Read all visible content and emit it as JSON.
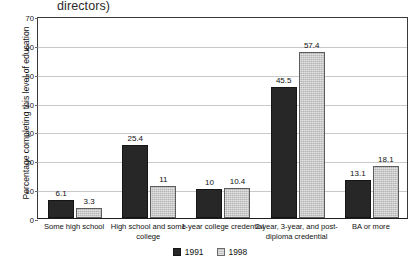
{
  "chart_data": {
    "type": "bar",
    "title": "directors)",
    "xlabel": "",
    "ylabel": "Percentage completing this level of education",
    "ylim": [
      0,
      70
    ],
    "ytick_step": 10,
    "yticks": [
      "0",
      "10",
      "20",
      "30",
      "40",
      "50",
      "60",
      "70"
    ],
    "grid": true,
    "legend_position": "bottom-center",
    "categories": [
      "Some high school",
      "High school and some college",
      "1-year college credential",
      "2-year, 3-year, and post-diploma credential",
      "BA or more"
    ],
    "series": [
      {
        "name": "1991",
        "color": "#272727",
        "values": [
          6.1,
          25.4,
          10,
          45.5,
          13.1
        ],
        "value_labels": [
          "6.1",
          "25.4",
          "10",
          "45.5",
          "13.1"
        ]
      },
      {
        "name": "1998",
        "color": "#b4b4b4",
        "values": [
          3.3,
          11,
          10.4,
          57.4,
          18.1
        ],
        "value_labels": [
          "3.3",
          "11",
          "10.4",
          "57.4",
          "18.1"
        ]
      }
    ]
  },
  "legend": {
    "items": [
      {
        "label": "1991"
      },
      {
        "label": "1998"
      }
    ]
  }
}
